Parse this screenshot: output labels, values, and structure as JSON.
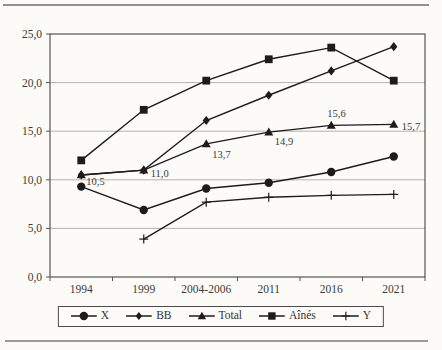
{
  "chart_data": {
    "type": "line",
    "categories": [
      "1994",
      "1999",
      "2004-2006",
      "2011",
      "2016",
      "2021"
    ],
    "ylim": [
      0,
      25
    ],
    "y_ticks": [
      0,
      5,
      10,
      15,
      20,
      25
    ],
    "y_tick_labels": [
      "0,0",
      "5,0",
      "10,0",
      "15,0",
      "20,0",
      "25,0"
    ],
    "grid": "horizontal",
    "legend_position": "bottom",
    "line_color": "#1c1c1c",
    "grid_color": "#b5b2ab",
    "border_color": "#555550",
    "text_color": "#3a3a38",
    "series": [
      {
        "name": "X",
        "marker": "circle",
        "values": [
          9.3,
          6.9,
          9.1,
          9.7,
          10.8,
          12.4
        ]
      },
      {
        "name": "BB",
        "marker": "diamond",
        "values": [
          10.5,
          11.0,
          16.1,
          18.7,
          21.2,
          23.7
        ]
      },
      {
        "name": "Total",
        "marker": "triangle",
        "values": [
          10.5,
          11.0,
          13.7,
          14.9,
          15.6,
          15.7
        ],
        "labels": [
          "10,5",
          "11,0",
          "13,7",
          "14,9",
          "15,6",
          "15,7"
        ],
        "label_offsets": [
          [
            5,
            10
          ],
          [
            7,
            7
          ],
          [
            6,
            14
          ],
          [
            6,
            13
          ],
          [
            -4,
            -8
          ],
          [
            8,
            6
          ]
        ]
      },
      {
        "name": "Aînés",
        "marker": "square",
        "values": [
          12.0,
          17.2,
          20.2,
          22.4,
          23.6,
          20.2
        ]
      },
      {
        "name": "Y",
        "marker": "plus",
        "values": [
          null,
          3.9,
          7.7,
          8.2,
          8.4,
          8.5
        ]
      }
    ]
  }
}
